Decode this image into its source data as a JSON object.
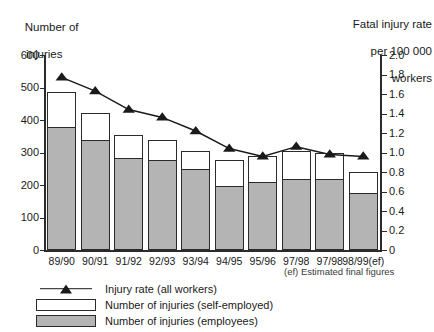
{
  "chart_data": {
    "type": "bar",
    "title": "",
    "subtitle": "",
    "categories": [
      "89/90",
      "90/91",
      "91/92",
      "92/93",
      "93/94",
      "94/95",
      "95/96",
      "97/98",
      "97/98",
      "98/99(ef)"
    ],
    "series": [
      {
        "name": "Number of injuries (employees)",
        "axis": "left",
        "type": "bar",
        "color": "#b4b4b4",
        "values": [
          378,
          337,
          282,
          278,
          248,
          198,
          208,
          218,
          218,
          175
        ]
      },
      {
        "name": "Number of injuries (self-employed)",
        "axis": "left",
        "type": "bar",
        "color": "#ffffff",
        "values": [
          107,
          85,
          73,
          62,
          57,
          80,
          82,
          87,
          82,
          65
        ]
      },
      {
        "name": "Injury rate (all workers)",
        "axis": "right",
        "type": "line",
        "color": "#1a1a1a",
        "values": [
          1.77,
          1.63,
          1.44,
          1.36,
          1.22,
          1.04,
          0.96,
          1.06,
          0.98,
          0.96
        ]
      }
    ],
    "totals": [
      485,
      422,
      355,
      340,
      305,
      278,
      290,
      305,
      300,
      240
    ],
    "xlabel": "",
    "ylabel": "Number of injuries",
    "y2label": "Fatal injury rate per 100 000 workers",
    "ylim": [
      0,
      600
    ],
    "y2lim": [
      0,
      2.0
    ],
    "ytick_labels": [
      "0",
      "100",
      "200",
      "300",
      "400",
      "500",
      "600"
    ],
    "y2tick_labels": [
      "0",
      "0.2",
      "0.4",
      "0.6",
      "0.8",
      "1.0",
      "1.2",
      "1.4",
      "1.6",
      "1.8",
      "2.0"
    ],
    "grid": false,
    "legend_position": "bottom-left",
    "annotations": [
      "(ef) Estimated final figures"
    ]
  },
  "axes": {
    "left_title_line1": "Number of",
    "left_title_line2": "injuries",
    "right_title_line1": "Fatal injury rate",
    "right_title_line2": "per 100 000",
    "right_title_line3": "workers"
  },
  "footnote": "(ef) Estimated final figures",
  "legend": {
    "items": [
      {
        "key": "line-marker",
        "label": "Injury rate (all workers)"
      },
      {
        "key": "white-box",
        "label": "Number of injuries (self-employed)"
      },
      {
        "key": "gray-box",
        "label": "Number of injuries (employees)"
      }
    ]
  },
  "colors": {
    "employees_fill": "#b4b4b4",
    "self_employed_fill": "#ffffff",
    "line": "#1a1a1a",
    "axis": "#2b2b2b"
  }
}
